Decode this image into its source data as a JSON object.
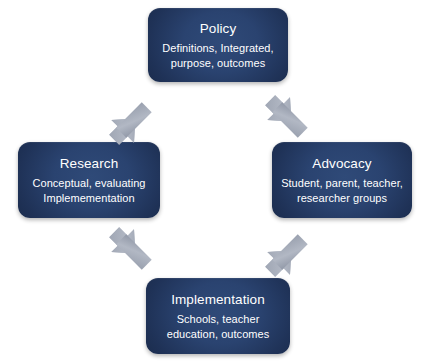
{
  "diagram": {
    "colors": {
      "background": "#ffffff",
      "node_fill_light": "#2f4a78",
      "node_fill_dark": "#152440",
      "node_text": "#ffffff",
      "arrow_fill": "#a8aebb",
      "arrow_shade": "#8e95a4"
    },
    "nodes": [
      {
        "id": "policy",
        "title": "Policy",
        "desc_lines": [
          "Definitions, Integrated,",
          "purpose, outcomes"
        ]
      },
      {
        "id": "research",
        "title": "Research",
        "desc_lines": [
          "Conceptual, evaluating",
          "Implemementation"
        ]
      },
      {
        "id": "advocacy",
        "title": "Advocacy",
        "desc_lines": [
          "Student, parent, teacher,",
          "researcher groups"
        ]
      },
      {
        "id": "implementation",
        "title": "Implementation",
        "desc_lines": [
          "Schools, teacher",
          "education, outcomes"
        ]
      }
    ],
    "arrows": [
      {
        "id": "policy-research",
        "from": "policy",
        "to": "research",
        "style": "double-headed",
        "direction": "diagonal-up-right"
      },
      {
        "id": "policy-advocacy",
        "from": "policy",
        "to": "advocacy",
        "style": "double-headed",
        "direction": "diagonal-down-right"
      },
      {
        "id": "research-impl",
        "from": "research",
        "to": "implementation",
        "style": "double-headed",
        "direction": "diagonal-down-right"
      },
      {
        "id": "advocacy-impl",
        "from": "advocacy",
        "to": "implementation",
        "style": "double-headed",
        "direction": "diagonal-up-right"
      }
    ]
  }
}
